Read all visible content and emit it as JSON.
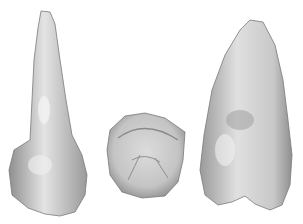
{
  "image": {
    "description": "Three views of a tooth on white background: lateral root view, occlusal crown view, and buccal view",
    "background": "#ffffff",
    "tooth_color_light": "#e8e8e8",
    "tooth_color_mid": "#bdbdbd",
    "tooth_color_dark": "#8a8a8a",
    "specimens": [
      {
        "name": "lateral-view"
      },
      {
        "name": "occlusal-view"
      },
      {
        "name": "buccal-view"
      }
    ]
  }
}
